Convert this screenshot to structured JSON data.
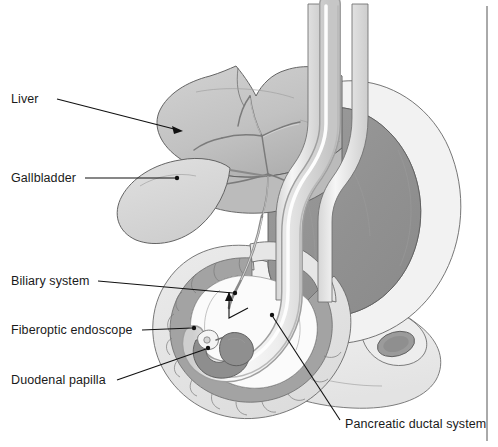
{
  "figure": {
    "background_color": "#ffffff",
    "width": 498,
    "height": 447
  },
  "labels": [
    {
      "id": "liver",
      "text": "Liver",
      "x": 11,
      "y": 103,
      "anchor": "start",
      "leader": "M 57 99 L 182 131",
      "marker": "arrow",
      "marker_point": [
        182,
        131
      ]
    },
    {
      "id": "gallbladder",
      "text": "Gallbladder",
      "x": 11,
      "y": 182,
      "anchor": "start",
      "leader": "M 85 178 L 176 178",
      "marker": "dot",
      "marker_point": [
        176,
        178
      ]
    },
    {
      "id": "biliary-system",
      "text": "Biliary system",
      "x": 11,
      "y": 285,
      "anchor": "start",
      "leader": "M 98 281 L 236 293",
      "marker": "dot",
      "marker_point": [
        236,
        293
      ]
    },
    {
      "id": "fiberoptic-endoscope",
      "text": "Fiberoptic endoscope",
      "x": 11,
      "y": 334,
      "anchor": "start",
      "leader": "M 142 330 L 195 328",
      "marker": "dot",
      "marker_point": [
        195,
        328
      ]
    },
    {
      "id": "duodenal-papilla",
      "text": "Duodenal papilla",
      "x": 11,
      "y": 384,
      "anchor": "start",
      "leader": "M 117 380 L 208 348",
      "marker": "dot",
      "marker_point": [
        208,
        348
      ]
    },
    {
      "id": "pancreatic-ductal-system",
      "text": "Pancreatic ductal system",
      "x": 345,
      "y": 428,
      "anchor": "start",
      "leader": "M 340 421 L 272 315",
      "marker": "dot",
      "marker_point": [
        272,
        315
      ]
    }
  ],
  "internal_pointers": [
    {
      "id": "papilla-arrow",
      "path": "M 229 292 L 229 316 L 246 307",
      "note": "arrow from bile duct junction down to papilla region"
    }
  ],
  "colors": {
    "background": "#ffffff",
    "stomach_lumen": "#969696",
    "liver_fill": "#c8c8c8",
    "liver_shadow": "#b4b4b4",
    "gallbladder_fill": "#d8d8d8",
    "duodenum_mucosa": "#a8a8a8",
    "duodenum_wall": "#e2e2e2",
    "pancreas_fill": "#efefef",
    "endoscope_fill": "#f2f2f2",
    "endoscope_tip": "#8e8e8e",
    "outline": "#555555",
    "label_text": "#1a1a1a",
    "border_rule": "#555555"
  },
  "border_rule": {
    "x": 487,
    "y_top": 6,
    "y_bottom": 441
  }
}
